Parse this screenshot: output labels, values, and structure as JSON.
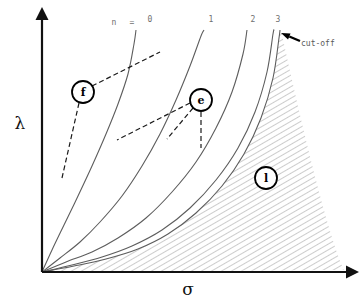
{
  "figure": {
    "kind": "line-plot-with-hatched-region",
    "axes": {
      "y_label": "λ",
      "x_label": "σ",
      "origin": [
        42,
        272
      ],
      "y_top": [
        42,
        18
      ],
      "x_right": [
        348,
        272
      ]
    },
    "series_prefix": {
      "n_symbol": "n",
      "equals_symbol": "="
    },
    "annotations": {
      "cutoff_label": "cut-off",
      "badge_f": "f",
      "badge_e": "e",
      "badge_l": "l"
    }
  },
  "chart_data": {
    "type": "line",
    "title": "",
    "xlabel": "σ",
    "ylabel": "λ",
    "grid": false,
    "legend": "inline-top",
    "xlim": [
      0,
      1
    ],
    "ylim": [
      0,
      1
    ],
    "note": "Family of monotonically increasing curves from the origin; region to the right of the n=3 curve is hatched (cut-off region).",
    "series": [
      {
        "name": "0",
        "label_text": "0",
        "label_xy": [
          150,
          22
        ],
        "top_xy": [
          134,
          30
        ],
        "points": [
          [
            42,
            272
          ],
          [
            52,
            250
          ],
          [
            64,
            225
          ],
          [
            78,
            196
          ],
          [
            92,
            166
          ],
          [
            106,
            134
          ],
          [
            118,
            104
          ],
          [
            128,
            74
          ],
          [
            134,
            44
          ],
          [
            136,
            30
          ]
        ]
      },
      {
        "name": "1",
        "label_text": "1",
        "label_xy": [
          211,
          22
        ],
        "top_xy": [
          203,
          30
        ],
        "points": [
          [
            42,
            272
          ],
          [
            60,
            258
          ],
          [
            80,
            242
          ],
          [
            100,
            222
          ],
          [
            122,
            196
          ],
          [
            142,
            166
          ],
          [
            160,
            134
          ],
          [
            176,
            100
          ],
          [
            190,
            66
          ],
          [
            201,
            36
          ],
          [
            204,
            30
          ]
        ]
      },
      {
        "name": "2",
        "label_text": "2",
        "label_xy": [
          253,
          22
        ],
        "top_xy": [
          246,
          30
        ],
        "points": [
          [
            42,
            272
          ],
          [
            66,
            262
          ],
          [
            92,
            252
          ],
          [
            118,
            238
          ],
          [
            146,
            218
          ],
          [
            172,
            192
          ],
          [
            196,
            162
          ],
          [
            216,
            128
          ],
          [
            232,
            92
          ],
          [
            243,
            54
          ],
          [
            247,
            30
          ]
        ]
      },
      {
        "name": "3",
        "label_text": "3",
        "label_xy": [
          278,
          22
        ],
        "top_xy": [
          272,
          30
        ],
        "points": [
          [
            42,
            272
          ],
          [
            72,
            265
          ],
          [
            102,
            257
          ],
          [
            132,
            246
          ],
          [
            162,
            230
          ],
          [
            190,
            208
          ],
          [
            216,
            180
          ],
          [
            238,
            148
          ],
          [
            255,
            112
          ],
          [
            267,
            72
          ],
          [
            273,
            34
          ],
          [
            274,
            30
          ]
        ]
      },
      {
        "name": "boundary",
        "label_text": "",
        "label_xy": [
          0,
          0
        ],
        "top_xy": [
          278,
          30
        ],
        "points": [
          [
            42,
            272
          ],
          [
            74,
            266
          ],
          [
            106,
            259
          ],
          [
            138,
            249
          ],
          [
            168,
            234
          ],
          [
            196,
            213
          ],
          [
            222,
            186
          ],
          [
            244,
            154
          ],
          [
            261,
            118
          ],
          [
            273,
            78
          ],
          [
            279,
            38
          ],
          [
            280,
            30
          ]
        ]
      }
    ],
    "hatched_region": {
      "name": "cut-off",
      "hatch_angle_deg": 60,
      "hatch_spacing_px": 5,
      "hatch_color": "#9a9a9a",
      "bounded_left_by": "boundary",
      "bounded_bottom_by": "x-axis",
      "bounded_right_by": "apex-taper-to-axis",
      "apex_xy": [
        281,
        30
      ],
      "right_foot_xy": [
        344,
        270
      ]
    },
    "callouts": [
      {
        "id": "f",
        "badge_xy": [
          83,
          92
        ],
        "badge_r": 11,
        "leaders": [
          [
            [
              92,
              86
            ],
            [
              160,
              52
            ]
          ],
          [
            [
              79,
              103
            ],
            [
              62,
              178
            ]
          ]
        ]
      },
      {
        "id": "e",
        "badge_xy": [
          201,
          100
        ],
        "badge_r": 11,
        "leaders": [
          [
            [
              190,
              103
            ],
            [
              117,
              140
            ]
          ],
          [
            [
              193,
              108
            ],
            [
              167,
              139
            ]
          ],
          [
            [
              201,
              112
            ],
            [
              201,
              148
            ]
          ]
        ]
      },
      {
        "id": "l",
        "badge_xy": [
          266,
          178
        ],
        "badge_r": 11,
        "leaders": []
      }
    ],
    "cutoff_pointer": {
      "text": "cut-off",
      "text_xy": [
        301,
        46
      ],
      "arrow_tail": [
        300,
        41
      ],
      "arrow_head": [
        281,
        33
      ]
    }
  }
}
